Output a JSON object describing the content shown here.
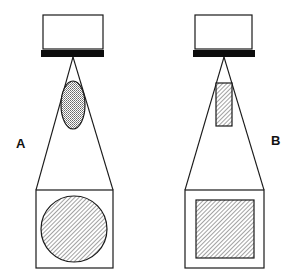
{
  "figure": {
    "panels": [
      {
        "id": "A",
        "label": "A",
        "projector": {
          "box": [
            43,
            15,
            60,
            33
          ],
          "bar": [
            41,
            50,
            63,
            7
          ],
          "lens": [
            73,
            57
          ]
        },
        "beam_object": {
          "shape": "ellipse",
          "cx": 73,
          "cy": 105,
          "rx": 12,
          "ry": 24,
          "fill": "stipple"
        },
        "screen": {
          "x": 36,
          "y": 190,
          "w": 77,
          "h": 78
        },
        "projected_image": {
          "shape": "circle",
          "cx": 74,
          "cy": 229,
          "r": 33,
          "fill": "hatch"
        }
      },
      {
        "id": "B",
        "label": "B",
        "projector": {
          "box": [
            195,
            15,
            57,
            33
          ],
          "bar": [
            193,
            50,
            62,
            7
          ],
          "lens": [
            224,
            57
          ]
        },
        "beam_object": {
          "shape": "rectangle",
          "x": 216,
          "y": 83,
          "w": 16,
          "h": 43,
          "fill": "hatch"
        },
        "screen": {
          "x": 185,
          "y": 190,
          "w": 79,
          "h": 78
        },
        "projected_image": {
          "shape": "square",
          "x": 196,
          "y": 200,
          "w": 58,
          "h": 58,
          "fill": "hatch"
        }
      }
    ]
  },
  "colors": {
    "line": "#1a1a1a",
    "bar": "#0d0d0d",
    "hatch": "#555555",
    "background": "#ffffff"
  }
}
